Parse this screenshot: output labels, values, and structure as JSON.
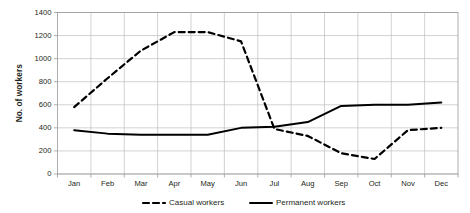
{
  "chart_data": {
    "type": "line",
    "title": "",
    "xlabel": "",
    "ylabel": "No. of workers",
    "categories": [
      "Jan",
      "Feb",
      "Mar",
      "Apr",
      "May",
      "Jun",
      "Jul",
      "Aug",
      "Sep",
      "Oct",
      "Nov",
      "Dec"
    ],
    "ylim": [
      0,
      1400
    ],
    "yticks": [
      0,
      200,
      400,
      600,
      800,
      1000,
      1200,
      1400
    ],
    "grid": true,
    "legend_position": "bottom",
    "series": [
      {
        "name": "Casual workers",
        "style": "dashed",
        "color": "#000000",
        "values": [
          580,
          830,
          1070,
          1230,
          1230,
          1150,
          390,
          330,
          180,
          130,
          380,
          400
        ]
      },
      {
        "name": "Permanent workers",
        "style": "solid",
        "color": "#000000",
        "values": [
          380,
          350,
          340,
          340,
          340,
          400,
          410,
          450,
          590,
          600,
          600,
          620
        ]
      }
    ]
  },
  "axis": {
    "y_title": "No. of workers",
    "y_tick_labels": [
      "1400",
      "1200",
      "1000",
      "800",
      "600",
      "400",
      "200",
      "0"
    ],
    "x_tick_labels": [
      "Jan",
      "Feb",
      "Mar",
      "Apr",
      "May",
      "Jun",
      "Jul",
      "Aug",
      "Sep",
      "Oct",
      "Nov",
      "Dec"
    ]
  },
  "legend": {
    "items": [
      {
        "label": "Casual workers",
        "style": "dashed"
      },
      {
        "label": "Permanent workers",
        "style": "solid"
      }
    ]
  }
}
